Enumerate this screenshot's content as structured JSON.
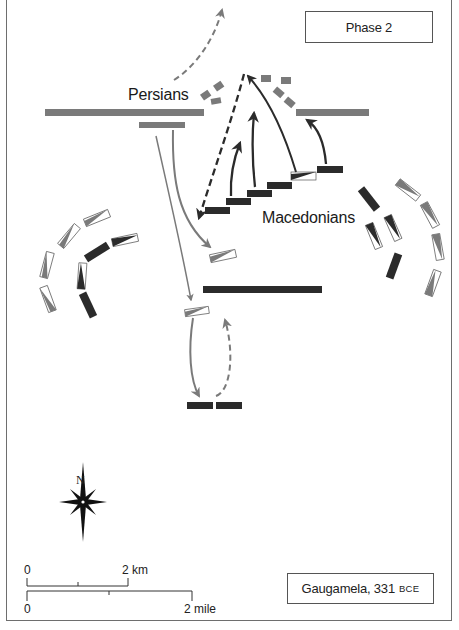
{
  "map": {
    "phase_label": "Phase 2",
    "caption": {
      "name": "Gaugamela, 331",
      "era": "BCE"
    },
    "armies": {
      "persians": {
        "label": "Persians",
        "color": "#7a7a7a"
      },
      "macedonians": {
        "label": "Macedonians",
        "color": "#2b2b2b"
      }
    },
    "compass": {
      "north_label": "N"
    },
    "scale_bar": {
      "km": {
        "start_label": "0",
        "end_label": "2 km"
      },
      "mile": {
        "start_label": "0",
        "end_label": "2 mile"
      }
    },
    "colors": {
      "persian_unit": "#7a7a7a",
      "macedonian_unit": "#2b2b2b",
      "persian_arrow": "#7a7a7a",
      "macedonian_arrow": "#2b2b2b",
      "frame": "#6e6e6e"
    }
  }
}
